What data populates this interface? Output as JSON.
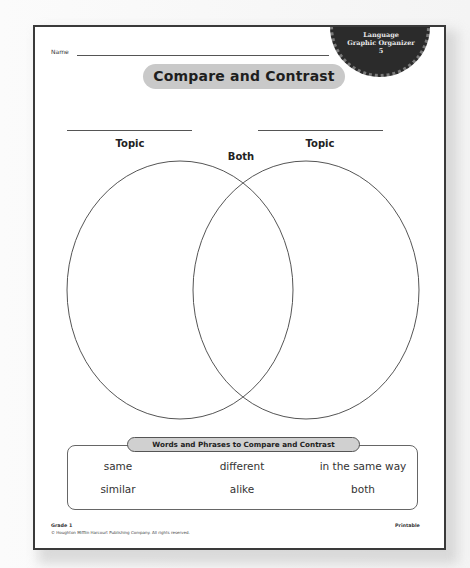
{
  "worksheet": {
    "badge": {
      "line1": "Language",
      "line2": "Graphic Organizer",
      "number": "5"
    },
    "name_label": "Name",
    "title": "Compare and Contrast",
    "venn": {
      "left_topic_label": "Topic",
      "right_topic_label": "Topic",
      "both_label": "Both"
    },
    "word_bank": {
      "title": "Words and Phrases to Compare and Contrast",
      "rows": [
        [
          "same",
          "different",
          "in the same way"
        ],
        [
          "similar",
          "alike",
          "both"
        ]
      ]
    },
    "footer": {
      "grade": "Grade 1",
      "copyright": "© Houghton Mifflin Harcourt Publishing Company. All rights reserved.",
      "printable": "Printable"
    }
  }
}
